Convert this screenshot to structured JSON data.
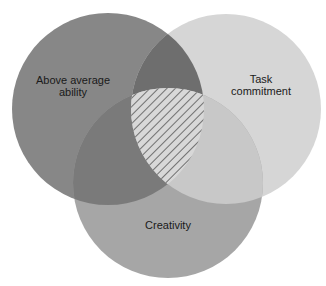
{
  "diagram": {
    "type": "venn",
    "circles": [
      {
        "id": "ability",
        "label_lines": [
          "Above average",
          "ability"
        ],
        "cx": 108,
        "cy": 109,
        "r": 96,
        "color": "#878787",
        "label_x": 73,
        "label_y": 80
      },
      {
        "id": "commitment",
        "label_lines": [
          "Task",
          "commitment"
        ],
        "cx": 226,
        "cy": 109,
        "r": 95,
        "color": "#d6d6d6",
        "label_x": 261,
        "label_y": 79
      },
      {
        "id": "creativity",
        "label_lines": [
          "Creativity"
        ],
        "cx": 168,
        "cy": 183,
        "r": 95,
        "color": "#a6a6a6",
        "label_x": 168,
        "label_y": 225
      }
    ],
    "overlap_colors": {
      "ability_commitment": "#6e6e6e",
      "ability_creativity": "#7a7a7a",
      "commitment_creativity": "#c8c8c8",
      "all_three_background": "#d8d8d8",
      "all_three_hatch": "#2a2a2a"
    },
    "center_region": "hatched"
  },
  "labels": {
    "ability_line1": "Above average",
    "ability_line2": "ability",
    "commitment_line1": "Task",
    "commitment_line2": "commitment",
    "creativity": "Creativity"
  }
}
